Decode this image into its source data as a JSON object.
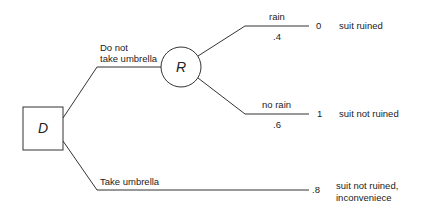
{
  "diagram": {
    "type": "decision-tree",
    "nodes": {
      "decision": {
        "label": "D",
        "shape": "square"
      },
      "chance": {
        "label": "R",
        "shape": "circle"
      }
    },
    "branches": {
      "no_umbrella": {
        "label_line1": "Do not",
        "label_line2": "take umbrella"
      },
      "umbrella": {
        "label": "Take umbrella"
      },
      "rain": {
        "label": "rain",
        "probability": ".4"
      },
      "no_rain": {
        "label": "no rain",
        "probability": ".6"
      }
    },
    "outcomes": {
      "rain": {
        "utility": "0",
        "description": "suit ruined"
      },
      "no_rain": {
        "utility": "1",
        "description": "suit not ruined"
      },
      "umbrella": {
        "utility": ".8",
        "description_line1": "suit not ruined,",
        "description_line2": "inconveniece"
      }
    },
    "colors": {
      "line": "#333333",
      "text": "#222222",
      "background": "#ffffff"
    }
  }
}
